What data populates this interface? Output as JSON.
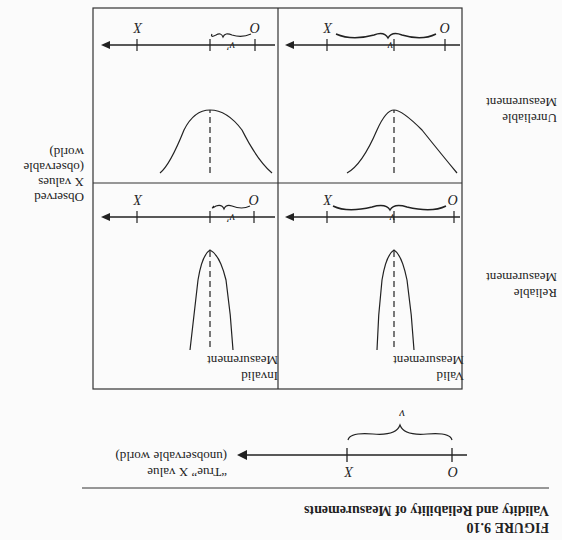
{
  "figure": {
    "number": "FIGURE 9.10",
    "title": "Validity and Reliability of Measurements"
  },
  "true_value_line": {
    "label_line1": "“True” X value",
    "label_line2": "(unobservable world)",
    "tick_x": "X",
    "tick_o": "O",
    "brace": "v"
  },
  "side_labels": {
    "observed_line1": "Observed",
    "observed_line2": "X values",
    "observed_line3": "(observable",
    "observed_line4": "world)"
  },
  "column_headers": {
    "valid_line1": "Valid",
    "valid_line2": "Measurement",
    "invalid_line1": "Invalid",
    "invalid_line2": "Measurement"
  },
  "row_headers": {
    "reliable_line1": "Reliable",
    "reliable_line2": "Measurement",
    "unreliable_line1": "Unreliable",
    "unreliable_line2": "Measurement"
  },
  "panels": {
    "valid_reliable": {
      "x": "X",
      "o": "O",
      "brace": "v"
    },
    "invalid_reliable": {
      "x": "X",
      "o": "O",
      "brace": "v′"
    },
    "valid_unreliable": {
      "x": "X",
      "o": "O",
      "brace": "v"
    },
    "invalid_unreliable": {
      "x": "X",
      "o": "O",
      "brace": "v′"
    }
  }
}
